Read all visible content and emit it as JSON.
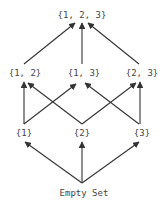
{
  "diagram": {
    "type": "hasse-diagram",
    "colors": {
      "edge": "#333333",
      "text": "#444444",
      "background": "#ffffff"
    },
    "nodes": [
      {
        "id": "top",
        "label": "{1, 2, 3}",
        "x": 82,
        "y": 18
      },
      {
        "id": "s12",
        "label": "{1, 2}",
        "x": 25,
        "y": 76
      },
      {
        "id": "s13",
        "label": "{1, 3}",
        "x": 84,
        "y": 76
      },
      {
        "id": "s23",
        "label": "{2, 3}",
        "x": 142,
        "y": 76
      },
      {
        "id": "s1",
        "label": "{1}",
        "x": 24,
        "y": 136
      },
      {
        "id": "s2",
        "label": "{2}",
        "x": 82,
        "y": 136
      },
      {
        "id": "s3",
        "label": "{3}",
        "x": 142,
        "y": 136
      },
      {
        "id": "empty",
        "label": "Empty Set",
        "x": 84,
        "y": 196
      }
    ],
    "edges": [
      {
        "from": "empty",
        "to": "s1"
      },
      {
        "from": "empty",
        "to": "s2"
      },
      {
        "from": "empty",
        "to": "s3"
      },
      {
        "from": "s1",
        "to": "s12"
      },
      {
        "from": "s1",
        "to": "s13"
      },
      {
        "from": "s2",
        "to": "s12"
      },
      {
        "from": "s2",
        "to": "s23"
      },
      {
        "from": "s3",
        "to": "s13"
      },
      {
        "from": "s3",
        "to": "s23"
      },
      {
        "from": "s12",
        "to": "top"
      },
      {
        "from": "s13",
        "to": "top"
      },
      {
        "from": "s23",
        "to": "top"
      }
    ]
  }
}
